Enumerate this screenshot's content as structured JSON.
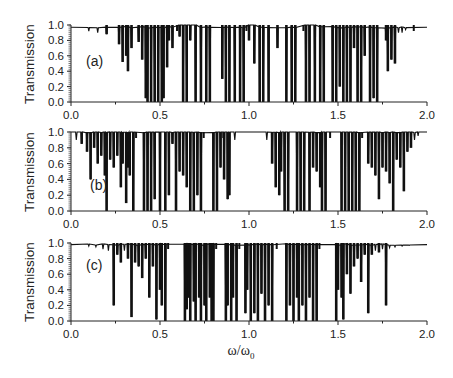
{
  "figure": {
    "xlabel": "ω/ω",
    "xlabel_sub": "0",
    "ylabel": "Transmission"
  },
  "chart_data": [
    {
      "type": "line",
      "panel": "(a)",
      "title": "",
      "xlabel": "ω/ω0",
      "ylabel": "Transmission",
      "xlim": [
        0.0,
        2.0
      ],
      "ylim": [
        0.0,
        1.0
      ],
      "xticks": [
        "0.0",
        "0.5",
        "1.0",
        "1.5",
        "2.0"
      ],
      "yticks": [
        "0.0",
        "0.2",
        "0.4",
        "0.6",
        "0.8",
        "1.0"
      ],
      "baseline": 0.97,
      "gaps": [
        [
          0.59,
          0.72
        ],
        [
          0.98,
          1.04
        ],
        [
          1.3,
          1.39
        ],
        [
          1.92,
          2.0
        ]
      ],
      "dips": [
        [
          0.1,
          0.92
        ],
        [
          0.15,
          0.9
        ],
        [
          0.2,
          0.88
        ],
        [
          0.27,
          0.75
        ],
        [
          0.29,
          0.52
        ],
        [
          0.31,
          0.6
        ],
        [
          0.32,
          0.4
        ],
        [
          0.34,
          0.7
        ],
        [
          0.38,
          0.78
        ],
        [
          0.4,
          0.55
        ],
        [
          0.42,
          0.05
        ],
        [
          0.43,
          0.0
        ],
        [
          0.45,
          0.0
        ],
        [
          0.47,
          0.0
        ],
        [
          0.49,
          0.0
        ],
        [
          0.51,
          0.0
        ],
        [
          0.52,
          0.05
        ],
        [
          0.54,
          0.45
        ],
        [
          0.55,
          0.8
        ],
        [
          0.57,
          0.7
        ],
        [
          0.61,
          0.85
        ],
        [
          0.63,
          0.0
        ],
        [
          0.65,
          0.0
        ],
        [
          0.67,
          0.8
        ],
        [
          0.7,
          0.0
        ],
        [
          0.73,
          0.0
        ],
        [
          0.76,
          0.0
        ],
        [
          0.78,
          0.0
        ],
        [
          0.85,
          0.3
        ],
        [
          0.87,
          0.0
        ],
        [
          0.89,
          0.0
        ],
        [
          0.92,
          0.0
        ],
        [
          0.95,
          0.0
        ],
        [
          0.97,
          0.0
        ],
        [
          1.0,
          0.8
        ],
        [
          1.03,
          0.5
        ],
        [
          1.06,
          0.0
        ],
        [
          1.08,
          0.0
        ],
        [
          1.11,
          0.0
        ],
        [
          1.16,
          0.7
        ],
        [
          1.21,
          0.0
        ],
        [
          1.24,
          0.0
        ],
        [
          1.26,
          0.0
        ],
        [
          1.32,
          0.0
        ],
        [
          1.34,
          0.0
        ],
        [
          1.37,
          0.0
        ],
        [
          1.4,
          0.0
        ],
        [
          1.42,
          0.0
        ],
        [
          1.47,
          0.0
        ],
        [
          1.49,
          0.0
        ],
        [
          1.51,
          0.2
        ],
        [
          1.53,
          0.0
        ],
        [
          1.55,
          0.0
        ],
        [
          1.57,
          0.0
        ],
        [
          1.59,
          0.7
        ],
        [
          1.61,
          0.0
        ],
        [
          1.63,
          0.0
        ],
        [
          1.65,
          0.6
        ],
        [
          1.68,
          0.0
        ],
        [
          1.7,
          0.05
        ],
        [
          1.72,
          0.0
        ],
        [
          1.77,
          0.8
        ],
        [
          1.78,
          0.4
        ],
        [
          1.8,
          0.55
        ],
        [
          1.82,
          0.5
        ],
        [
          1.84,
          0.9
        ],
        [
          1.86,
          0.9
        ],
        [
          1.88,
          0.94
        ]
      ]
    },
    {
      "type": "line",
      "panel": "(b)",
      "title": "",
      "xlabel": "ω/ω0",
      "ylabel": "Transmission",
      "xlim": [
        0.0,
        2.0
      ],
      "ylim": [
        0.0,
        1.0
      ],
      "xticks": [
        "0.0",
        "0.5",
        "1.0",
        "1.5",
        "2.0"
      ],
      "yticks": [
        "0.0",
        "0.2",
        "0.4",
        "0.6",
        "0.8",
        "1.0"
      ],
      "baseline": 1.0,
      "gaps": [
        [
          0.36,
          0.4
        ],
        [
          0.74,
          0.78
        ],
        [
          0.85,
          1.1
        ],
        [
          1.45,
          1.5
        ],
        [
          1.63,
          1.66
        ]
      ],
      "dips": [
        [
          0.03,
          0.9
        ],
        [
          0.06,
          0.85
        ],
        [
          0.09,
          0.75
        ],
        [
          0.11,
          0.4
        ],
        [
          0.13,
          0.8
        ],
        [
          0.15,
          0.6
        ],
        [
          0.17,
          0.7
        ],
        [
          0.19,
          0.45
        ],
        [
          0.2,
          0.0
        ],
        [
          0.22,
          0.65
        ],
        [
          0.24,
          0.55
        ],
        [
          0.26,
          0.7
        ],
        [
          0.28,
          0.3
        ],
        [
          0.29,
          0.6
        ],
        [
          0.31,
          0.1
        ],
        [
          0.32,
          0.55
        ],
        [
          0.33,
          0.45
        ],
        [
          0.35,
          0.0
        ],
        [
          0.41,
          0.0
        ],
        [
          0.43,
          0.0
        ],
        [
          0.45,
          0.0
        ],
        [
          0.47,
          0.15
        ],
        [
          0.5,
          0.0
        ],
        [
          0.53,
          0.0
        ],
        [
          0.55,
          0.2
        ],
        [
          0.57,
          0.85
        ],
        [
          0.59,
          0.0
        ],
        [
          0.61,
          0.5
        ],
        [
          0.63,
          0.45
        ],
        [
          0.65,
          0.3
        ],
        [
          0.67,
          0.0
        ],
        [
          0.69,
          0.0
        ],
        [
          0.71,
          0.2
        ],
        [
          0.73,
          0.0
        ],
        [
          0.8,
          0.0
        ],
        [
          0.82,
          0.0
        ],
        [
          0.84,
          0.55
        ],
        [
          0.86,
          0.4
        ],
        [
          0.88,
          0.15
        ],
        [
          0.89,
          0.2
        ],
        [
          0.92,
          0.9
        ],
        [
          1.1,
          0.9
        ],
        [
          1.13,
          0.6
        ],
        [
          1.15,
          0.3
        ],
        [
          1.17,
          0.2
        ],
        [
          1.18,
          0.5
        ],
        [
          1.2,
          0.0
        ],
        [
          1.22,
          0.0
        ],
        [
          1.27,
          0.0
        ],
        [
          1.29,
          0.0
        ],
        [
          1.31,
          0.0
        ],
        [
          1.34,
          0.0
        ],
        [
          1.36,
          0.55
        ],
        [
          1.38,
          0.5
        ],
        [
          1.4,
          0.3
        ],
        [
          1.41,
          0.0
        ],
        [
          1.43,
          0.0
        ],
        [
          1.52,
          0.0
        ],
        [
          1.54,
          0.0
        ],
        [
          1.56,
          0.0
        ],
        [
          1.58,
          0.0
        ],
        [
          1.6,
          0.0
        ],
        [
          1.62,
          0.0
        ],
        [
          1.67,
          0.6
        ],
        [
          1.69,
          0.55
        ],
        [
          1.71,
          0.45
        ],
        [
          1.73,
          0.15
        ],
        [
          1.75,
          0.55
        ],
        [
          1.77,
          0.5
        ],
        [
          1.79,
          0.35
        ],
        [
          1.81,
          0.0
        ],
        [
          1.83,
          0.65
        ],
        [
          1.85,
          0.55
        ],
        [
          1.87,
          0.25
        ],
        [
          1.89,
          0.75
        ],
        [
          1.91,
          0.8
        ],
        [
          1.93,
          0.9
        ],
        [
          1.95,
          0.95
        ]
      ]
    },
    {
      "type": "line",
      "panel": "(c)",
      "title": "",
      "xlabel": "ω/ω0",
      "ylabel": "Transmission",
      "xlim": [
        0.0,
        2.0
      ],
      "ylim": [
        0.0,
        1.0
      ],
      "xticks": [
        "0.0",
        "0.5",
        "1.0",
        "1.5",
        "2.0"
      ],
      "yticks": [
        "0.0",
        "0.2",
        "0.4",
        "0.6",
        "0.8",
        "1.0"
      ],
      "baseline": 0.98,
      "gaps": [
        [
          0.54,
          0.63
        ],
        [
          0.81,
          0.85
        ],
        [
          0.94,
          0.97
        ],
        [
          1.15,
          1.19
        ],
        [
          1.39,
          1.48
        ]
      ],
      "dips": [
        [
          0.1,
          0.96
        ],
        [
          0.14,
          0.95
        ],
        [
          0.18,
          0.92
        ],
        [
          0.21,
          0.9
        ],
        [
          0.24,
          0.2
        ],
        [
          0.26,
          0.85
        ],
        [
          0.28,
          0.75
        ],
        [
          0.3,
          0.9
        ],
        [
          0.32,
          0.8
        ],
        [
          0.34,
          0.05
        ],
        [
          0.36,
          0.75
        ],
        [
          0.38,
          0.7
        ],
        [
          0.4,
          0.55
        ],
        [
          0.42,
          0.8
        ],
        [
          0.44,
          0.3
        ],
        [
          0.46,
          0.7
        ],
        [
          0.48,
          0.02
        ],
        [
          0.5,
          0.4
        ],
        [
          0.51,
          0.2
        ],
        [
          0.53,
          0.0
        ],
        [
          0.64,
          0.0
        ],
        [
          0.65,
          0.15
        ],
        [
          0.66,
          0.3
        ],
        [
          0.67,
          0.0
        ],
        [
          0.69,
          0.25
        ],
        [
          0.7,
          0.0
        ],
        [
          0.72,
          0.3
        ],
        [
          0.73,
          0.0
        ],
        [
          0.75,
          0.2
        ],
        [
          0.76,
          0.0
        ],
        [
          0.78,
          0.3
        ],
        [
          0.79,
          0.0
        ],
        [
          0.8,
          0.0
        ],
        [
          0.87,
          0.0
        ],
        [
          0.88,
          0.2
        ],
        [
          0.9,
          0.0
        ],
        [
          0.91,
          0.3
        ],
        [
          0.93,
          0.0
        ],
        [
          0.98,
          0.1
        ],
        [
          0.99,
          0.4
        ],
        [
          1.01,
          0.0
        ],
        [
          1.03,
          0.1
        ],
        [
          1.05,
          0.0
        ],
        [
          1.07,
          0.35
        ],
        [
          1.09,
          0.0
        ],
        [
          1.11,
          0.2
        ],
        [
          1.13,
          0.0
        ],
        [
          1.21,
          0.0
        ],
        [
          1.23,
          0.2
        ],
        [
          1.25,
          0.0
        ],
        [
          1.27,
          0.3
        ],
        [
          1.28,
          0.0
        ],
        [
          1.3,
          0.2
        ],
        [
          1.32,
          0.0
        ],
        [
          1.34,
          0.3
        ],
        [
          1.36,
          0.0
        ],
        [
          1.38,
          0.0
        ],
        [
          1.49,
          0.0
        ],
        [
          1.5,
          0.4
        ],
        [
          1.52,
          0.3
        ],
        [
          1.53,
          0.02
        ],
        [
          1.55,
          0.6
        ],
        [
          1.57,
          0.35
        ],
        [
          1.59,
          0.7
        ],
        [
          1.61,
          0.8
        ],
        [
          1.63,
          0.5
        ],
        [
          1.65,
          0.85
        ],
        [
          1.67,
          0.1
        ],
        [
          1.69,
          0.85
        ],
        [
          1.71,
          0.9
        ],
        [
          1.73,
          0.88
        ],
        [
          1.75,
          0.92
        ],
        [
          1.77,
          0.2
        ],
        [
          1.79,
          0.94
        ],
        [
          1.82,
          0.95
        ],
        [
          1.86,
          0.96
        ],
        [
          1.9,
          0.97
        ]
      ]
    }
  ]
}
